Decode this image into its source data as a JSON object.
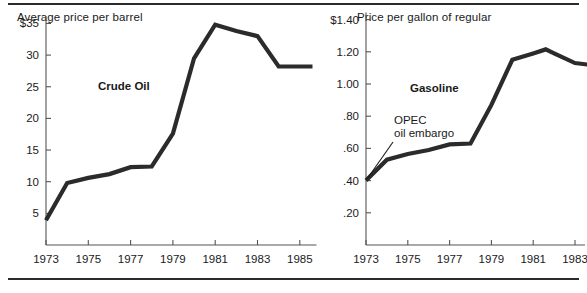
{
  "figure": {
    "rule_top": "top-rule",
    "rule_bottom": "bottom-rule"
  },
  "chart_data": [
    {
      "id": "crude-oil",
      "type": "line",
      "title": "Average price per barrel",
      "series_label": "Crude Oil",
      "xlabel": "",
      "ylabel": "Average price per barrel",
      "grid": false,
      "legend": "inline-label",
      "xlim": [
        1973,
        1985.6
      ],
      "ylim": [
        0,
        36
      ],
      "xticks": [
        1973,
        1975,
        1977,
        1979,
        1981,
        1983,
        1985
      ],
      "xticklabels": [
        "1973",
        "1975",
        "1977",
        "1979",
        "1981",
        "1983",
        "1985"
      ],
      "yticks": [
        5,
        10,
        15,
        20,
        25,
        30,
        35
      ],
      "yticklabels": [
        "5",
        "10",
        "15",
        "20",
        "25",
        "30",
        "$35"
      ],
      "x": [
        1973,
        1974,
        1975,
        1976,
        1977,
        1978,
        1979,
        1980,
        1981,
        1982,
        1983,
        1984,
        1985,
        1985.6
      ],
      "values": [
        3.9,
        9.8,
        10.6,
        11.2,
        12.3,
        12.4,
        17.6,
        29.5,
        34.8,
        33.8,
        33.0,
        28.2,
        28.2,
        28.2
      ],
      "annotations": []
    },
    {
      "id": "gasoline",
      "type": "line",
      "title": "Price per gallon of regular",
      "series_label": "Gasoline",
      "xlabel": "",
      "ylabel": "Price per gallon of regular",
      "grid": false,
      "legend": "inline-label",
      "xlim": [
        1973,
        1984.3
      ],
      "ylim": [
        0,
        1.45
      ],
      "xticks": [
        1973,
        1975,
        1977,
        1979,
        1981,
        1983
      ],
      "xticklabels": [
        "1973",
        "1975",
        "1977",
        "1979",
        "1981",
        "1983"
      ],
      "yticks": [
        0.2,
        0.4,
        0.6,
        0.8,
        1.0,
        1.2,
        1.4
      ],
      "yticklabels": [
        ".20",
        ".40",
        ".60",
        ".80",
        "1.00",
        "1.20",
        "$1.40"
      ],
      "x": [
        1973,
        1974,
        1975,
        1976,
        1977,
        1978,
        1979,
        1980,
        1981,
        1981.6,
        1982,
        1983,
        1984.3
      ],
      "values": [
        0.4,
        0.53,
        0.565,
        0.59,
        0.625,
        0.63,
        0.87,
        1.15,
        1.19,
        1.215,
        1.19,
        1.13,
        1.11
      ],
      "annotations": [
        {
          "name": "opec-oil-embargo",
          "line1": "OPEC",
          "line2": "oil embargo",
          "points_to_x": 1973.05,
          "points_to_y": 0.41
        }
      ]
    }
  ],
  "colors": {
    "line": "#2b2b2b",
    "axis": "#555555",
    "text": "#1a1a1a",
    "background": "#ffffff"
  }
}
